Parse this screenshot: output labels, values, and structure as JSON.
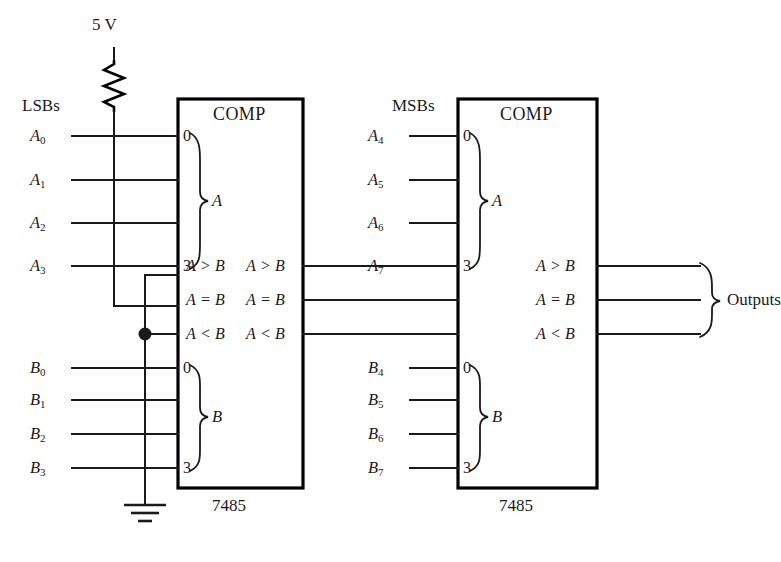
{
  "diagram": {
    "supply": {
      "label": "5 V"
    },
    "group_labels": {
      "lsb": "LSBs",
      "msb": "MSBs",
      "outputs": "Outputs"
    },
    "chips": [
      {
        "id": "lsb-comparator",
        "symbol": "COMP",
        "part_number": "7485",
        "a_group_label": "A",
        "b_group_label": "B",
        "pin_first": "0",
        "pin_last": "3",
        "a_inputs": [
          {
            "name": "A",
            "sub": "0"
          },
          {
            "name": "A",
            "sub": "1"
          },
          {
            "name": "A",
            "sub": "2"
          },
          {
            "name": "A",
            "sub": "3"
          }
        ],
        "b_inputs": [
          {
            "name": "B",
            "sub": "0"
          },
          {
            "name": "B",
            "sub": "1"
          },
          {
            "name": "B",
            "sub": "2"
          },
          {
            "name": "B",
            "sub": "3"
          }
        ],
        "cascade_inputs": [
          "A > B",
          "A = B",
          "A < B"
        ],
        "cascade_outputs": [
          "A > B",
          "A = B",
          "A < B"
        ]
      },
      {
        "id": "msb-comparator",
        "symbol": "COMP",
        "part_number": "7485",
        "a_group_label": "A",
        "b_group_label": "B",
        "pin_first": "0",
        "pin_last": "3",
        "a_inputs": [
          {
            "name": "A",
            "sub": "4"
          },
          {
            "name": "A",
            "sub": "5"
          },
          {
            "name": "A",
            "sub": "6"
          },
          {
            "name": "A",
            "sub": "7"
          }
        ],
        "b_inputs": [
          {
            "name": "B",
            "sub": "4"
          },
          {
            "name": "B",
            "sub": "5"
          },
          {
            "name": "B",
            "sub": "6"
          },
          {
            "name": "B",
            "sub": "7"
          }
        ],
        "cascade_inputs": [
          "",
          "",
          ""
        ],
        "cascade_outputs": [
          "A > B",
          "A = B",
          "A < B"
        ]
      }
    ],
    "components": [
      {
        "type": "resistor",
        "name": "pull-up-resistor"
      },
      {
        "type": "ground",
        "name": "ground-symbol"
      },
      {
        "type": "junction",
        "name": "junction-dot"
      }
    ],
    "colors": {
      "line": "#1a1a1a",
      "chip_border": "#000000",
      "background": "#ffffff"
    }
  }
}
